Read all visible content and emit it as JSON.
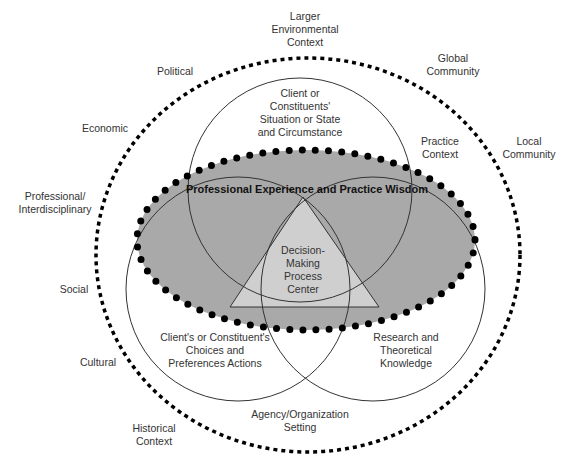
{
  "diagram": {
    "outer_context": {
      "label": "Larger\nEnvironmental\nContext",
      "items": [
        {
          "id": "political",
          "label": "Political"
        },
        {
          "id": "economic",
          "label": "Economic"
        },
        {
          "id": "professional",
          "label": "Professional/\nInterdisciplinary"
        },
        {
          "id": "social",
          "label": "Social"
        },
        {
          "id": "cultural",
          "label": "Cultural"
        },
        {
          "id": "historical",
          "label": "Historical\nContext"
        },
        {
          "id": "global",
          "label": "Global\nCommunity"
        },
        {
          "id": "local",
          "label": "Local\nCommunity"
        }
      ]
    },
    "practice_context": "Practice\nContext",
    "agency_setting": "Agency/Organization\nSetting",
    "ellipse_label": "Professional Experience and Practice Wisdom",
    "circles": [
      {
        "id": "situation",
        "label": "Client or\nConstituents'\nSituation or State\nand Circumstance"
      },
      {
        "id": "choices",
        "label": "Client's or Constituent's\nChoices and\nPreferences Actions"
      },
      {
        "id": "research",
        "label": "Research and\nTheoretical\nKnowledge"
      }
    ],
    "center_label": "Decision-\nMaking\nProcess\nCenter",
    "colors": {
      "ellipse_fill": "#a9a9a9",
      "triangle_fill": "#cfcfcf",
      "line": "#333333",
      "dots": "#000000"
    }
  }
}
